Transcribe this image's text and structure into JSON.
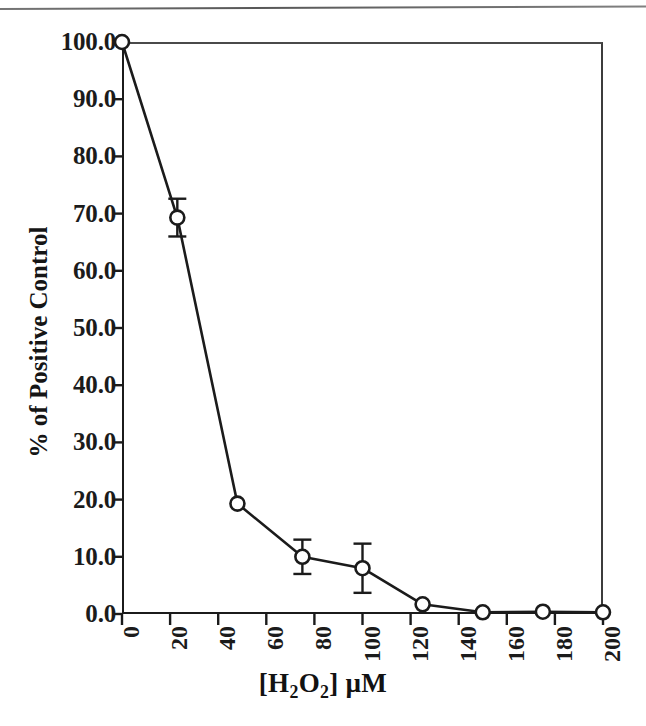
{
  "figure": {
    "background": "#ffffff",
    "ink_color": "#1b1b1b",
    "has_scan_artifact_line": true
  },
  "chart_data": {
    "type": "line",
    "title": "",
    "xlabel": "[H2O2] µM",
    "xlabel_parts": {
      "prefix": "[H",
      "sub1": "2",
      "mid": "O",
      "sub2": "2",
      "suffix": "] µM"
    },
    "ylabel": "% of Positive Control",
    "xlim": [
      0,
      200
    ],
    "ylim": [
      0,
      100
    ],
    "xticks": [
      0,
      20,
      40,
      60,
      80,
      100,
      120,
      140,
      160,
      180,
      200
    ],
    "xtick_labels": [
      "0",
      "20",
      "40",
      "60",
      "80",
      "100",
      "120",
      "140",
      "160",
      "180",
      "200"
    ],
    "yticks": [
      0,
      10,
      20,
      30,
      40,
      50,
      60,
      70,
      80,
      90,
      100
    ],
    "ytick_labels": [
      "0.0",
      "10.0",
      "20.0",
      "30.0",
      "40.0",
      "50.0",
      "60.0",
      "70.0",
      "80.0",
      "90.0",
      "100.0"
    ],
    "grid": false,
    "legend": null,
    "marker": "open-circle",
    "x": [
      0,
      23,
      48,
      75,
      100,
      125,
      150,
      175,
      200
    ],
    "y": [
      100.0,
      69.3,
      19.3,
      10.0,
      8.0,
      1.7,
      0.3,
      0.4,
      0.3
    ],
    "yerr": [
      0,
      3.3,
      0,
      3.0,
      4.3,
      0,
      0,
      0,
      0
    ],
    "series": [
      {
        "name": "% of Positive Control",
        "points": [
          {
            "x": 0,
            "y": 100.0,
            "err": 0
          },
          {
            "x": 23,
            "y": 69.3,
            "err": 3.3
          },
          {
            "x": 48,
            "y": 19.3,
            "err": 0
          },
          {
            "x": 75,
            "y": 10.0,
            "err": 3.0
          },
          {
            "x": 100,
            "y": 8.0,
            "err": 4.3
          },
          {
            "x": 125,
            "y": 1.7,
            "err": 0
          },
          {
            "x": 150,
            "y": 0.3,
            "err": 0
          },
          {
            "x": 175,
            "y": 0.4,
            "err": 0
          },
          {
            "x": 200,
            "y": 0.3,
            "err": 0
          }
        ]
      }
    ]
  }
}
